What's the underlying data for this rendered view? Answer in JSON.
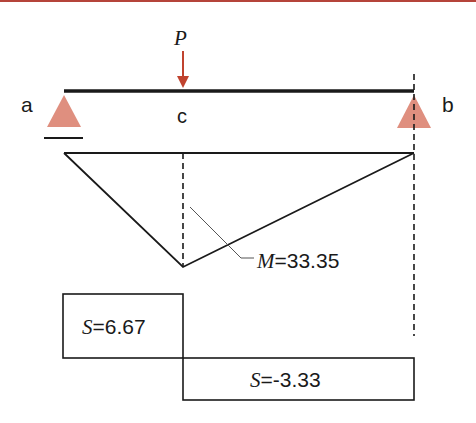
{
  "colors": {
    "top_rule": "#b5443a",
    "support": "#df8f7f",
    "load_arrow": "#c0432f",
    "line": "#1a1a1a",
    "leader": "#555555"
  },
  "labels": {
    "support_a": "a",
    "support_b": "b",
    "point_c": "c",
    "load": "P"
  },
  "moment": {
    "symbol": "M",
    "equals": "=",
    "value": "33.35"
  },
  "shear": [
    {
      "symbol": "S",
      "equals": "=",
      "value": "6.67"
    },
    {
      "symbol": "S",
      "equals": "=",
      "value": "-3.33"
    }
  ]
}
